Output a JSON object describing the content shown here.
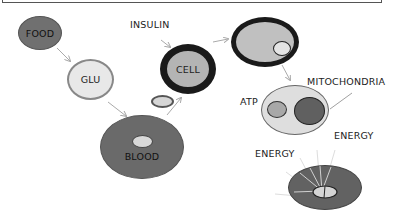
{
  "diagram": {
    "title": "",
    "nodes": {
      "food": {
        "label": "FOOD",
        "color": "#6e6e6e"
      },
      "glu": {
        "label": "GLU",
        "color": "#e8e8e8"
      },
      "blood": {
        "label": "BLOOD",
        "color": "#6a6a6a"
      },
      "cell": {
        "label": "CELL",
        "color": "#b4b4b4",
        "ring": "#1a1a1a"
      },
      "cell_with_glucose": {
        "label": "",
        "color": "#c0c0c0"
      },
      "mitochondria_cell": {
        "label": "",
        "color": "#dedede"
      },
      "energy_cell": {
        "label": "",
        "color": "#626262"
      }
    },
    "labels": {
      "insulin": "INSULIN",
      "mitochondria": "MITOCHONDRIA",
      "atp": "ATP",
      "energy_1": "ENERGY",
      "energy_2": "ENERGY"
    },
    "edges": [
      {
        "from": "FOOD",
        "to": "GLU"
      },
      {
        "from": "GLU",
        "to": "BLOOD"
      },
      {
        "from": "BLOOD",
        "to": "CELL"
      },
      {
        "from": "INSULIN",
        "to": "CELL"
      },
      {
        "from": "CELL",
        "to": "CELL (glucose inside)"
      },
      {
        "from": "CELL (glucose inside)",
        "to": "ATP / MITOCHONDRIA cell"
      },
      {
        "from": "MITOCHONDRIA label",
        "to": "mitochondrion"
      }
    ]
  }
}
